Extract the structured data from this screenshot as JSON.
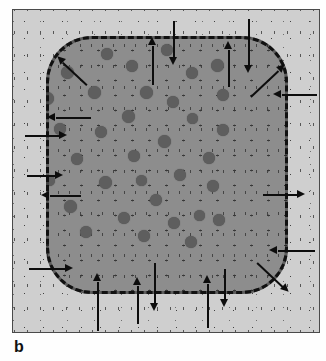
{
  "figure": {
    "panel_label": "b",
    "title": "",
    "colors": {
      "page_background": "#fefefe",
      "matrix_fill": "#cfcfcf",
      "domain_fill": "#8d8d8d",
      "inclusion_fill": "#5e5e5e",
      "boundary_stroke": "#111111",
      "arrow_stroke": "#0d0d0d",
      "panel_border": "#4a4a4a",
      "stipple_dot": "#3a3a3a"
    },
    "panel": {
      "x": 12,
      "y": 9,
      "width": 308,
      "height": 324,
      "border_width": 1
    },
    "domain": {
      "name": "rounded-square-domain",
      "x": 33,
      "y": 26,
      "width": 242,
      "height": 258,
      "corner_radius": 46,
      "boundary_style": "dashed",
      "boundary_width": 3
    },
    "inclusions": {
      "name": "circular-inclusions",
      "count": 34,
      "diameter_range": [
        9,
        14
      ],
      "items": [
        {
          "cx": 54,
          "cy": 62,
          "d": 13
        },
        {
          "cx": 94,
          "cy": 44,
          "d": 12
        },
        {
          "cx": 119,
          "cy": 56,
          "d": 12
        },
        {
          "cx": 154,
          "cy": 40,
          "d": 12
        },
        {
          "cx": 179,
          "cy": 63,
          "d": 12
        },
        {
          "cx": 204,
          "cy": 55,
          "d": 13
        },
        {
          "cx": 34,
          "cy": 88,
          "d": 13
        },
        {
          "cx": 81,
          "cy": 82,
          "d": 13
        },
        {
          "cx": 133,
          "cy": 82,
          "d": 13
        },
        {
          "cx": 160,
          "cy": 92,
          "d": 12
        },
        {
          "cx": 210,
          "cy": 85,
          "d": 12
        },
        {
          "cx": 115,
          "cy": 106,
          "d": 13
        },
        {
          "cx": 179,
          "cy": 108,
          "d": 11
        },
        {
          "cx": 47,
          "cy": 119,
          "d": 12
        },
        {
          "cx": 88,
          "cy": 122,
          "d": 12
        },
        {
          "cx": 210,
          "cy": 120,
          "d": 12
        },
        {
          "cx": 151,
          "cy": 131,
          "d": 13
        },
        {
          "cx": 121,
          "cy": 146,
          "d": 12
        },
        {
          "cx": 64,
          "cy": 149,
          "d": 12
        },
        {
          "cx": 196,
          "cy": 148,
          "d": 12
        },
        {
          "cx": 36,
          "cy": 170,
          "d": 11
        },
        {
          "cx": 92,
          "cy": 172,
          "d": 13
        },
        {
          "cx": 128,
          "cy": 170,
          "d": 11
        },
        {
          "cx": 167,
          "cy": 165,
          "d": 12
        },
        {
          "cx": 200,
          "cy": 176,
          "d": 12
        },
        {
          "cx": 57,
          "cy": 196,
          "d": 13
        },
        {
          "cx": 143,
          "cy": 190,
          "d": 12
        },
        {
          "cx": 186,
          "cy": 205,
          "d": 11
        },
        {
          "cx": 111,
          "cy": 208,
          "d": 12
        },
        {
          "cx": 161,
          "cy": 213,
          "d": 12
        },
        {
          "cx": 206,
          "cy": 210,
          "d": 12
        },
        {
          "cx": 73,
          "cy": 222,
          "d": 12
        },
        {
          "cx": 131,
          "cy": 226,
          "d": 12
        },
        {
          "cx": 178,
          "cy": 232,
          "d": 12
        }
      ]
    },
    "arrows": {
      "name": "flux-arrows",
      "total": 24,
      "legend": "inward arrows point into the domain; outward arrows point into the matrix",
      "top": [
        {
          "id": "top-up-1",
          "direction": "up",
          "sense": "outward",
          "x": 152,
          "tail_y": 84,
          "tip_y": 36
        },
        {
          "id": "top-down-1",
          "direction": "down",
          "sense": "inward",
          "x": 173,
          "tail_y": 20,
          "tip_y": 64
        },
        {
          "id": "top-up-2",
          "direction": "up",
          "sense": "outward",
          "x": 228,
          "tail_y": 86,
          "tip_y": 40
        },
        {
          "id": "top-down-2",
          "direction": "down",
          "sense": "inward",
          "x": 248,
          "tail_y": 18,
          "tip_y": 72
        }
      ],
      "bottom": [
        {
          "id": "bot-up-1",
          "direction": "up",
          "sense": "inward",
          "x": 97,
          "tail_y": 330,
          "tip_y": 272
        },
        {
          "id": "bot-up-2",
          "direction": "up",
          "sense": "inward",
          "x": 137,
          "tail_y": 323,
          "tip_y": 276
        },
        {
          "id": "bot-down-1",
          "direction": "down",
          "sense": "outward",
          "x": 154,
          "tail_y": 262,
          "tip_y": 310
        },
        {
          "id": "bot-up-3",
          "direction": "up",
          "sense": "inward",
          "x": 207,
          "tail_y": 327,
          "tip_y": 274
        },
        {
          "id": "bot-down-2",
          "direction": "down",
          "sense": "outward",
          "x": 224,
          "tail_y": 268,
          "tip_y": 306
        }
      ],
      "left": [
        {
          "id": "left-out-1",
          "direction": "left",
          "sense": "outward",
          "y": 117,
          "tail_x": 90,
          "tip_x": 46
        },
        {
          "id": "left-in-1",
          "direction": "right",
          "sense": "inward",
          "y": 135,
          "tail_x": 24,
          "tip_x": 66
        },
        {
          "id": "left-in-2",
          "direction": "right",
          "sense": "inward",
          "y": 175,
          "tail_x": 26,
          "tip_x": 62
        },
        {
          "id": "left-out-2",
          "direction": "left",
          "sense": "outward",
          "y": 195,
          "tail_x": 80,
          "tip_x": 40
        },
        {
          "id": "left-in-3",
          "direction": "right",
          "sense": "inward",
          "y": 268,
          "tail_x": 28,
          "tip_x": 72
        }
      ],
      "right": [
        {
          "id": "right-in-1",
          "direction": "left",
          "sense": "inward",
          "y": 94,
          "tail_x": 316,
          "tip_x": 272
        },
        {
          "id": "right-out-1",
          "direction": "right",
          "sense": "outward",
          "y": 194,
          "tail_x": 262,
          "tip_x": 304
        },
        {
          "id": "right-in-2",
          "direction": "left",
          "sense": "inward",
          "y": 250,
          "tail_x": 314,
          "tip_x": 268
        }
      ],
      "diagonal": [
        {
          "id": "diag-tl-out",
          "direction": "up-left",
          "sense": "outward",
          "tail_x": 86,
          "tail_y": 84,
          "tip_x": 56,
          "tip_y": 56
        },
        {
          "id": "diag-tr-out",
          "direction": "up-right",
          "sense": "outward",
          "tail_x": 250,
          "tail_y": 96,
          "tip_x": 284,
          "tip_y": 64
        },
        {
          "id": "diag-br-out",
          "direction": "down-right",
          "sense": "outward",
          "tail_x": 256,
          "tail_y": 262,
          "tip_x": 288,
          "tip_y": 292
        }
      ]
    }
  }
}
